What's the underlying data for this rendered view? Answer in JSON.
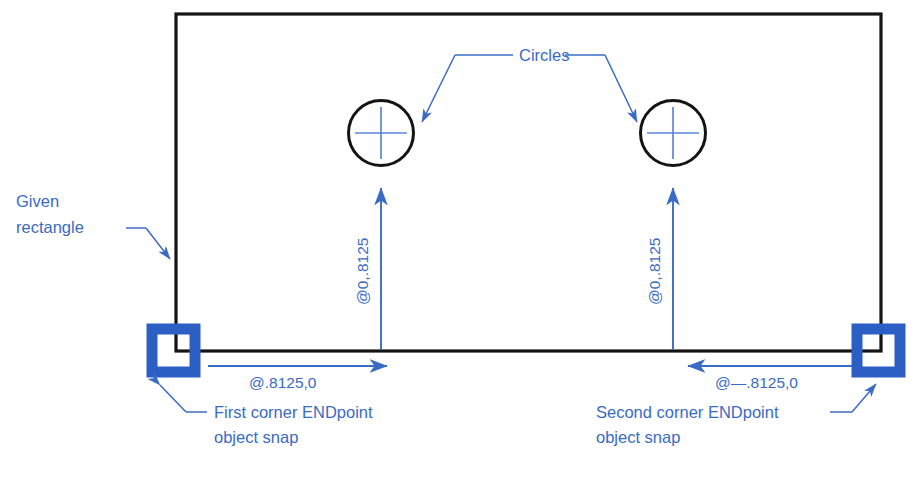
{
  "diagram": {
    "title_label": "Circles",
    "given_rectangle_label_line1": "Given",
    "given_rectangle_label_line2": "rectangle",
    "dimension_horizontal_left": "@.8125,0",
    "dimension_horizontal_right": "@—.8125,0",
    "dimension_vertical_left": "@0,.8125",
    "dimension_vertical_right": "@0,.8125",
    "first_corner_label_line1": "First corner ENDpoint",
    "first_corner_label_line2": "object snap",
    "second_corner_label_line1": "Second corner ENDpoint",
    "second_corner_label_line2": "object snap",
    "colors": {
      "annotation_blue": "#3a6bc4",
      "snap_marker_blue": "#2c5fc4",
      "geometry_black": "#141414",
      "background": "#ffffff"
    }
  }
}
